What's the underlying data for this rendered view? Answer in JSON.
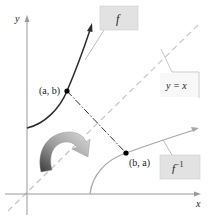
{
  "diagram": {
    "axes": {
      "x_label": "x",
      "y_label": "y"
    },
    "labels": {
      "f": "f",
      "f_inverse_base": "f",
      "f_inverse_sup": "−1",
      "line": "y = x",
      "point_ab": "(a, b)",
      "point_ba": "(b, a)"
    },
    "colors": {
      "axis": "#9a9a9a",
      "curve_f": "#2b2b2b",
      "curve_finv": "#a8a8a8",
      "diagonal": "#c8c8c8",
      "label_box": "#e2e2e2",
      "label_border": "#bdbdbd",
      "point": "#000000"
    }
  }
}
